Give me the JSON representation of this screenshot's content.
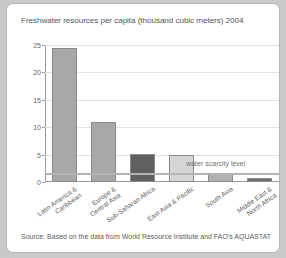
{
  "figure": {
    "source_note": "Source: Based on the data from World Resource Institute and FAO's AQUASTAT"
  },
  "chart_data": {
    "type": "bar",
    "title": "Freshwater resources per capita (thousand cubic meters) 2004",
    "xlabel": "",
    "ylabel": "",
    "ylim": [
      0,
      25
    ],
    "yticks": [
      0,
      5,
      10,
      15,
      20,
      25
    ],
    "grid": true,
    "legend": "none",
    "categories": [
      "Latin America & Caribbean",
      "Europe & Central Asia",
      "Sub-Saharan Africa",
      "East Asia & Pacific",
      "South Asia",
      "Middle East & North Africa"
    ],
    "category_lines": [
      [
        "Latin America &",
        "Caribbean"
      ],
      [
        "Europe &",
        "Central Asia"
      ],
      [
        "Sub-Saharan Africa",
        ""
      ],
      [
        "East Asia & Pacific",
        ""
      ],
      [
        "South Asia",
        ""
      ],
      [
        "Middle East &",
        "North Africa"
      ]
    ],
    "values": [
      24.4,
      11.0,
      5.1,
      5.0,
      1.5,
      0.8
    ],
    "bar_colors": [
      "#a8a8a8",
      "#a8a8a8",
      "#606060",
      "#d5d5d5",
      "#b0b0b0",
      "#6e6e6e"
    ],
    "bar_edge_color": "#8a8a8a",
    "annotations": [
      {
        "text": "water scarcity level",
        "value": 1.7,
        "kind": "hline"
      }
    ],
    "scarcity_level": 1.7,
    "scarcity_label": "water scarcity level",
    "colors": {
      "gridline": "#e2e2e2",
      "axis": "#9a9a9a",
      "title_text": "#555555",
      "scarcity_line": "#b4b4b4",
      "card_background": "#ffffff",
      "page_background": "#c9c9c9"
    }
  }
}
